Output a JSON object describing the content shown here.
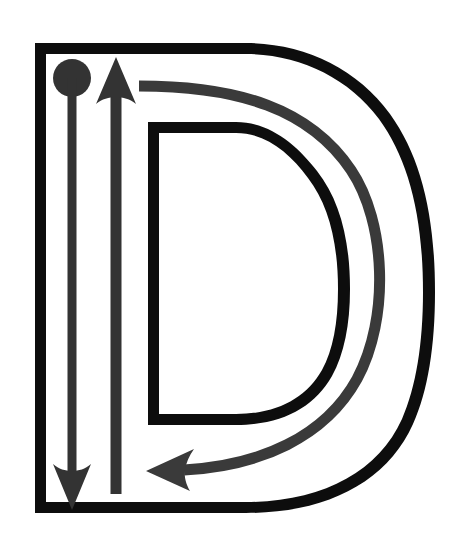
{
  "document": {
    "title": "Letter D Stroke Order Diagram",
    "type": "handwriting-stroke-order",
    "letter": "D",
    "letter_case": "uppercase",
    "background_color": "#ffffff"
  },
  "canvas": {
    "width": 467,
    "height": 540
  },
  "glyph": {
    "name": "letter-D-outline",
    "description": "Uppercase letter D drawn as a hollow outline",
    "stroke_color": "#0d0d0d",
    "fill_color": "#ffffff",
    "outline_width": 11,
    "outer_path": "M 35 43 L 35 513 L 248 513 C 368 513 435 426 435 278 C 435 130 368 43 248 43 Z",
    "inner_path": "M 148 122 L 148 425 L 236 425 C 306 425 345 372 345 278 C 345 184 306 122 236 122 Z"
  },
  "annotations": {
    "start_marker": {
      "name": "start-dot",
      "shape": "circle",
      "color": "#333333",
      "cx": 72,
      "cy": 78,
      "r": 19,
      "meaning": "pen start position for stroke 1"
    },
    "strokes": [
      {
        "id": 1,
        "name": "stroke-1-down-arrow",
        "label": "Stroke 1: vertical stem downward",
        "color": "#333333",
        "direction": "down",
        "shaft_width": 9,
        "shaft_x": 72,
        "shaft_from_y": 78,
        "shaft_to_y": 470,
        "head_tip_x": 72,
        "head_tip_y": 510,
        "head_half_width": 19,
        "head_length": 42
      },
      {
        "id": 2,
        "name": "stroke-2-up-arrow",
        "label": "Stroke 2 return: vertical upward",
        "color": "#333333",
        "direction": "up",
        "shaft_width": 11,
        "shaft_x": 116,
        "shaft_from_y": 494,
        "shaft_to_y": 100,
        "head_tip_x": 116,
        "head_tip_y": 57,
        "head_half_width": 20,
        "head_length": 45
      },
      {
        "id": 3,
        "name": "stroke-3-bowl-curve-arrow",
        "label": "Stroke 3: curved bowl, clockwise to the left",
        "color": "#3a3a3a",
        "direction": "clockwise-then-left",
        "shaft_width": 11,
        "start_x": 138,
        "start_y": 86,
        "curve_path": "M 138 86 C 250 86 320 110 360 175 C 395 235 392 330 355 390 C 320 445 255 468 175 470",
        "head_tip_x": 146,
        "head_tip_y": 471,
        "head_half_width": 19,
        "head_length": 45
      }
    ]
  },
  "colors": {
    "letter_outline": "#0d0d0d",
    "arrow_primary": "#333333",
    "arrow_secondary": "#3a3a3a",
    "page_background": "#ffffff"
  },
  "accessibility": {
    "alt_text": "Uppercase letter D stroke order diagram: a dot marks the start at the top left, an arrow travels down the vertical stem, a second arrow returns upward, and a curved arrow sweeps right and around the bowl back to the left."
  }
}
